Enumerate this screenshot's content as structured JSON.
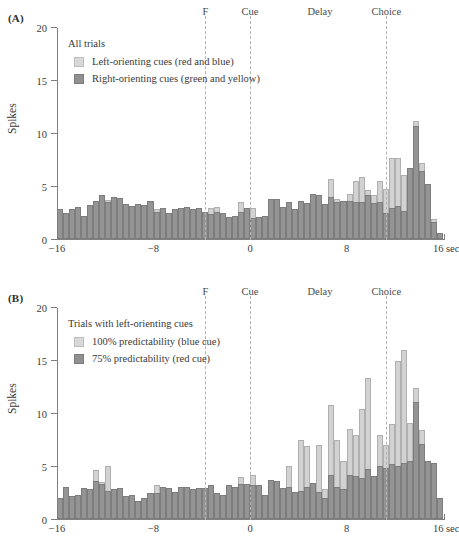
{
  "figure": {
    "panels": [
      {
        "panel_label": "(A)",
        "legend_title": "All trials",
        "legend": [
          {
            "swatch": "light",
            "label": "Left-orienting cues (red and blue)"
          },
          {
            "swatch": "dark",
            "label": "Right-orienting cues (green and yellow)"
          }
        ]
      },
      {
        "panel_label": "(B)",
        "legend_title": "Trials with left-orienting cues",
        "legend": [
          {
            "swatch": "light",
            "label": "100% predictability (blue cue)"
          },
          {
            "swatch": "dark",
            "label": "75% predictability (red cue)"
          }
        ]
      }
    ],
    "events": [
      {
        "name": "F",
        "label": "F",
        "time": -3.7,
        "line": true
      },
      {
        "name": "Cue",
        "label": "Cue",
        "time": 0.0,
        "line": true
      },
      {
        "name": "Delay",
        "label": "Delay",
        "time": 5.8,
        "line": false
      },
      {
        "name": "Choice",
        "label": "Choice",
        "time": 11.3,
        "line": true
      }
    ],
    "colors": {
      "light_bar": "#d2d2d2",
      "dark_bar": "#949494",
      "axis": "#808080",
      "event_line": "#b3b3b3",
      "text": "#3a3a3a"
    }
  },
  "chart_data": [
    {
      "type": "bar",
      "panel": "A",
      "title": "All trials",
      "xlabel": "",
      "ylabel": "Spikes",
      "xunit": "sec",
      "xlim": [
        -16,
        16
      ],
      "ylim": [
        0,
        20
      ],
      "xticks": [
        -16,
        -8,
        0,
        8,
        16
      ],
      "xtick_labels": [
        "−16",
        "−8",
        "0",
        "8",
        "16 sec"
      ],
      "yticks": [
        0,
        5,
        10,
        15,
        20
      ],
      "ytick_labels": [
        "0",
        "5",
        "10",
        "15",
        "20"
      ],
      "grid": false,
      "legend_position": "upper-left-inside",
      "bin_width": 0.5,
      "overlay": "back-to-front (light behind, dark in front)",
      "x": [
        -16.0,
        -15.5,
        -15.0,
        -14.5,
        -14.0,
        -13.5,
        -13.0,
        -12.5,
        -12.0,
        -11.5,
        -11.0,
        -10.5,
        -10.0,
        -9.5,
        -9.0,
        -8.5,
        -8.0,
        -7.5,
        -7.0,
        -6.5,
        -6.0,
        -5.5,
        -5.0,
        -4.5,
        -4.0,
        -3.5,
        -3.0,
        -2.5,
        -2.0,
        -1.5,
        -1.0,
        -0.5,
        0.0,
        0.5,
        1.0,
        1.5,
        2.0,
        2.5,
        3.0,
        3.5,
        4.0,
        4.5,
        5.0,
        5.5,
        6.0,
        6.5,
        7.0,
        7.5,
        8.0,
        8.5,
        9.0,
        9.5,
        10.0,
        10.5,
        11.0,
        11.5,
        12.0,
        12.5,
        13.0,
        13.5,
        14.0,
        14.5,
        15.0,
        15.5
      ],
      "series": [
        {
          "name": "Left-orienting cues (red and blue)",
          "swatch": "light",
          "values": [
            2.8,
            2.5,
            2.8,
            3.0,
            2.2,
            3.2,
            3.6,
            4.2,
            3.7,
            4.0,
            3.9,
            3.3,
            3.1,
            3.3,
            3.2,
            3.6,
            2.8,
            2.9,
            2.5,
            2.8,
            2.9,
            3.0,
            2.8,
            2.9,
            2.6,
            2.9,
            3.0,
            2.5,
            2.1,
            2.2,
            3.5,
            2.9,
            2.9,
            2.1,
            2.2,
            3.8,
            3.8,
            3.0,
            3.5,
            2.8,
            3.6,
            3.4,
            4.3,
            4.2,
            3.3,
            5.7,
            3.8,
            3.6,
            4.3,
            5.5,
            5.9,
            4.6,
            4.2,
            5.5,
            4.7,
            7.7,
            7.7,
            6.1,
            6.7,
            11.2,
            7.2,
            5.2,
            1.9,
            0.6
          ]
        },
        {
          "name": "Right-orienting cues (green and yellow)",
          "swatch": "dark",
          "values": [
            2.8,
            2.5,
            2.8,
            3.0,
            2.2,
            3.2,
            3.6,
            4.2,
            3.5,
            4.0,
            3.9,
            3.3,
            3.1,
            3.3,
            3.2,
            3.6,
            2.6,
            2.9,
            2.5,
            2.8,
            2.9,
            3.0,
            2.8,
            2.9,
            2.6,
            2.4,
            2.6,
            2.5,
            2.1,
            2.2,
            2.6,
            2.9,
            2.0,
            2.1,
            2.2,
            3.8,
            3.8,
            3.0,
            3.5,
            2.8,
            3.6,
            3.4,
            4.3,
            4.2,
            3.3,
            4.0,
            3.5,
            3.6,
            3.6,
            3.5,
            3.5,
            4.2,
            3.4,
            3.5,
            2.5,
            2.9,
            3.1,
            2.7,
            6.7,
            10.7,
            6.4,
            5.2,
            1.6,
            0.6
          ]
        }
      ]
    },
    {
      "type": "bar",
      "panel": "B",
      "title": "Trials with left-orienting cues",
      "xlabel": "",
      "ylabel": "Spikes",
      "xunit": "sec",
      "xlim": [
        -16,
        16
      ],
      "ylim": [
        0,
        20
      ],
      "xticks": [
        -16,
        -8,
        0,
        8,
        16
      ],
      "xtick_labels": [
        "−16",
        "−8",
        "0",
        "8",
        "16 sec"
      ],
      "yticks": [
        0,
        5,
        10,
        15,
        20
      ],
      "ytick_labels": [
        "0",
        "5",
        "10",
        "15",
        "20"
      ],
      "grid": false,
      "legend_position": "upper-left-inside",
      "bin_width": 0.5,
      "overlay": "back-to-front (light behind, dark in front)",
      "x": [
        -16.0,
        -15.5,
        -15.0,
        -14.5,
        -14.0,
        -13.5,
        -13.0,
        -12.5,
        -12.0,
        -11.5,
        -11.0,
        -10.5,
        -10.0,
        -9.5,
        -9.0,
        -8.5,
        -8.0,
        -7.5,
        -7.0,
        -6.5,
        -6.0,
        -5.5,
        -5.0,
        -4.5,
        -4.0,
        -3.5,
        -3.0,
        -2.5,
        -2.0,
        -1.5,
        -1.0,
        -0.5,
        0.0,
        0.5,
        1.0,
        1.5,
        2.0,
        2.5,
        3.0,
        3.5,
        4.0,
        4.5,
        5.0,
        5.5,
        6.0,
        6.5,
        7.0,
        7.5,
        8.0,
        8.5,
        9.0,
        9.5,
        10.0,
        10.5,
        11.0,
        11.5,
        12.0,
        12.5,
        13.0,
        13.5,
        14.0,
        14.5,
        15.0,
        15.5
      ],
      "series": [
        {
          "name": "100% predictability (blue cue)",
          "swatch": "light",
          "values": [
            2.0,
            3.0,
            2.2,
            2.3,
            2.9,
            2.8,
            4.6,
            3.5,
            5.0,
            2.8,
            2.9,
            2.2,
            2.3,
            1.7,
            2.0,
            2.5,
            3.2,
            3.0,
            2.9,
            2.6,
            3.0,
            3.0,
            2.8,
            2.9,
            2.9,
            3.2,
            2.5,
            2.3,
            3.2,
            3.0,
            4.0,
            3.3,
            4.2,
            3.2,
            2.3,
            3.7,
            3.6,
            2.9,
            5.0,
            2.6,
            7.5,
            6.9,
            3.4,
            7.0,
            2.8,
            10.8,
            7.5,
            5.5,
            8.5,
            8.0,
            10.4,
            13.4,
            4.1,
            8.0,
            7.0,
            9.0,
            15.0,
            16.0,
            9.1,
            12.4,
            8.4,
            5.4,
            5.3,
            2.0
          ]
        },
        {
          "name": "75% predictability (red cue)",
          "swatch": "dark",
          "values": [
            2.0,
            3.0,
            2.2,
            2.3,
            2.9,
            2.8,
            3.6,
            3.3,
            2.7,
            2.8,
            2.9,
            2.2,
            2.3,
            1.7,
            2.0,
            2.5,
            2.5,
            3.0,
            2.9,
            2.6,
            3.0,
            3.0,
            2.8,
            2.9,
            2.9,
            3.2,
            2.5,
            2.3,
            3.2,
            3.0,
            3.3,
            3.3,
            3.2,
            3.2,
            2.3,
            3.7,
            3.6,
            2.9,
            3.0,
            2.6,
            2.7,
            3.0,
            3.4,
            2.6,
            2.0,
            4.2,
            3.0,
            2.8,
            4.2,
            4.1,
            3.9,
            4.7,
            4.1,
            5.0,
            4.8,
            5.2,
            5.0,
            5.3,
            5.5,
            11.1,
            7.1,
            5.5,
            5.3,
            2.0
          ]
        }
      ]
    }
  ]
}
